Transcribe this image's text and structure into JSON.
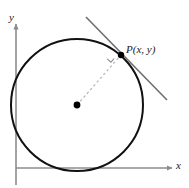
{
  "figure": {
    "type": "geometry-diagram",
    "background_color": "#ffffff",
    "axes": {
      "x_label": "x",
      "y_label": "y",
      "axis_color": "#8c8c8c",
      "x_axis": {
        "y": 168,
        "x_start": 16,
        "x_end": 172,
        "arrow": "right"
      },
      "y_axis": {
        "x": 16,
        "y_start": 185,
        "y_end": 24,
        "arrow": "up"
      }
    },
    "circle": {
      "center_x": 77,
      "center_y": 105,
      "radius": 66,
      "stroke_color": "#111111",
      "stroke_width": 2,
      "fill": "none"
    },
    "center_point": {
      "label": "",
      "x": 77,
      "y": 105,
      "radius": 3.4,
      "color": "#000000"
    },
    "tangent_point": {
      "label": "P(x, y)",
      "x": 121,
      "y": 55,
      "radius": 3.2,
      "color": "#000000"
    },
    "tangent_line": {
      "x1": 86,
      "y1": 17,
      "x2": 167,
      "y2": 100,
      "stroke_color": "#6e6e6e",
      "stroke_width": 1.6
    },
    "radius_line": {
      "x1": 77,
      "y1": 105,
      "x2": 121,
      "y2": 55,
      "stroke_color": "#b5b5b5",
      "stroke_width": 1.2,
      "dash": "2.5 2.5"
    },
    "right_angle_mark": {
      "points": "107.2,58.9 110.9,62.2 114.2,58.5",
      "stroke_color": "#8c8c8c",
      "stroke_width": 1.1
    }
  }
}
